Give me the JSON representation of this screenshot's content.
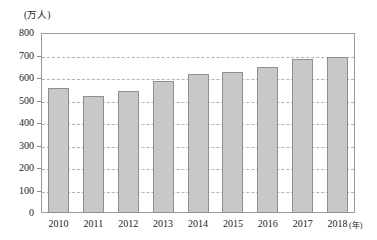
{
  "chart_data": {
    "type": "bar",
    "title": "",
    "subtitle": "",
    "xlabel": "(年)",
    "ylabel": "(万人)",
    "categories": [
      "2010",
      "2011",
      "2012",
      "2013",
      "2014",
      "2015",
      "2016",
      "2017",
      "2018"
    ],
    "values": [
      556,
      520,
      544,
      587,
      616,
      627,
      649,
      684,
      692
    ],
    "ylim": [
      0,
      800
    ],
    "ytick_step": 100,
    "yticks": [
      "0",
      "100",
      "200",
      "300",
      "400",
      "500",
      "600",
      "700",
      "800"
    ],
    "grid": true,
    "grid_style": "dashed-horizontal",
    "legend": false,
    "legend_position": "none",
    "series": [
      {
        "name": "人数",
        "values": [
          556,
          520,
          544,
          587,
          616,
          627,
          649,
          684,
          692
        ]
      }
    ]
  },
  "style": {
    "bar_fill": "#c8c8c8",
    "bar_border": "#8f8f8f",
    "frame_color": "#9a9a9a",
    "grid_color": "#b4b4b4",
    "text_color": "#222222",
    "background": "#ffffff"
  }
}
